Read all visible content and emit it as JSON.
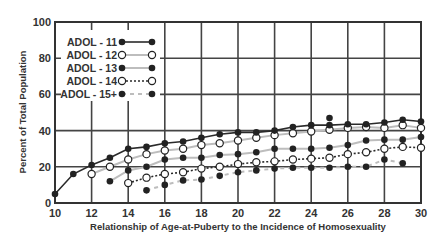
{
  "chart_data": {
    "type": "line",
    "title": "",
    "xlabel": "Relationship of Age-at-Puberty to the Incidence of Homosexuality",
    "ylabel": "Percent of Total Population",
    "xlim": [
      10,
      30
    ],
    "ylim": [
      0,
      100
    ],
    "xticks": [
      10,
      12,
      14,
      16,
      18,
      20,
      22,
      24,
      26,
      28,
      30
    ],
    "yticks": [
      0,
      20,
      40,
      60,
      80,
      100
    ],
    "grid": true,
    "legend_position": "upper-left (inside)",
    "series": [
      {
        "name": "ADOL - 11",
        "marker": "filled",
        "line": "solid-black",
        "x": [
          10,
          11,
          12,
          13,
          14,
          15,
          16,
          17,
          18,
          19,
          20,
          21,
          22,
          23,
          24,
          25,
          26,
          27,
          28,
          29,
          30
        ],
        "values": [
          5,
          16,
          21,
          25,
          30,
          31,
          33,
          34,
          36,
          38,
          39,
          39,
          40,
          42,
          43,
          43,
          43.5,
          43.5,
          44.5,
          46,
          45
        ],
        "extra_points": [
          {
            "x": 25,
            "y": 47
          }
        ]
      },
      {
        "name": "ADOL - 12",
        "marker": "open",
        "line": "solid-gray",
        "x": [
          12,
          13,
          14,
          15,
          16,
          17,
          18,
          19,
          20,
          21,
          22,
          23,
          24,
          25,
          26,
          27,
          28,
          29,
          30
        ],
        "values": [
          16,
          20,
          24,
          27,
          29,
          30,
          32,
          33,
          34.5,
          36,
          37.5,
          38.5,
          39.5,
          40.5,
          41.5,
          42,
          41.5,
          43,
          41.5
        ]
      },
      {
        "name": "ADOL - 13",
        "marker": "filled",
        "line": "solid-gray",
        "x": [
          13,
          14,
          15,
          16,
          17,
          18,
          19,
          20,
          21,
          22,
          23,
          24,
          25,
          26,
          27,
          28,
          29,
          30
        ],
        "values": [
          12,
          18,
          20,
          24,
          25,
          25,
          26.5,
          27,
          28,
          30,
          30,
          30,
          30.5,
          32,
          34.5,
          35,
          35,
          36.5
        ]
      },
      {
        "name": "ADOL - 14",
        "marker": "open",
        "line": "dotted-black",
        "x": [
          14,
          15,
          16,
          17,
          18,
          19,
          20,
          21,
          22,
          23,
          24,
          25,
          26,
          27,
          28,
          29,
          30
        ],
        "values": [
          11,
          14,
          16,
          17,
          19,
          20,
          21.5,
          22.5,
          23,
          24,
          24.5,
          25,
          27,
          28,
          30,
          31,
          30.5
        ]
      },
      {
        "name": "ADOL - 15+",
        "marker": "filled",
        "line": "dashed-gray",
        "x": [
          15,
          16,
          17,
          18,
          19,
          20,
          21,
          22,
          23,
          24,
          25,
          26,
          27,
          28,
          29
        ],
        "values": [
          7,
          10,
          12.5,
          13,
          15,
          17,
          18,
          19,
          19.5,
          19.5,
          19.5,
          20,
          20,
          24,
          22
        ]
      }
    ]
  },
  "legend": {
    "items": [
      "ADOL - 11",
      "ADOL - 12",
      "ADOL - 13",
      "ADOL - 14",
      "ADOL - 15+"
    ]
  },
  "axes": {
    "xlabel": "Relationship of Age-at-Puberty to the Incidence of Homosexuality",
    "ylabel": "Percent of Total Population",
    "xticks": [
      "10",
      "12",
      "14",
      "16",
      "18",
      "20",
      "22",
      "24",
      "26",
      "28",
      "30"
    ],
    "yticks": [
      "0",
      "20",
      "40",
      "60",
      "80",
      "100"
    ]
  },
  "colors": {
    "axis": "#333333",
    "grid": "#444444",
    "dark_line": "#2a2a2a",
    "gray_line": "#bdbdbd",
    "marker": "#222222"
  }
}
